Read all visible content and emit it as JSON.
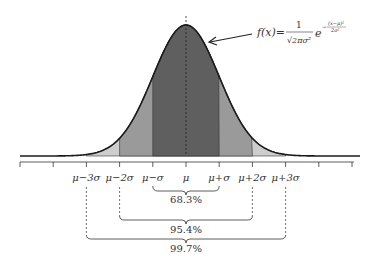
{
  "diagram": {
    "formula": {
      "lhs": "f(x)=",
      "numerator": "1",
      "denominator": "√2πσ²",
      "base": "e",
      "exponent_num": "(x−μ)²",
      "exponent_den": "2σ²",
      "exponent_sign": "−"
    },
    "axis_labels": [
      "μ−3σ",
      "μ−2σ",
      "μ−σ",
      "μ",
      "μ+σ",
      "μ+2σ",
      "μ+3σ"
    ],
    "axis_sigmas": [
      -3,
      -2,
      -1,
      0,
      1,
      2,
      3
    ],
    "intervals": [
      {
        "sigma": 1,
        "label": "68.3%"
      },
      {
        "sigma": 2,
        "label": "95.4%"
      },
      {
        "sigma": 3,
        "label": "99.7%"
      }
    ],
    "colors": {
      "band1": "#5f5f5f",
      "band2": "#9a9a9a",
      "band3": "#cdcdcd",
      "curve": "#1a1a1a"
    }
  }
}
